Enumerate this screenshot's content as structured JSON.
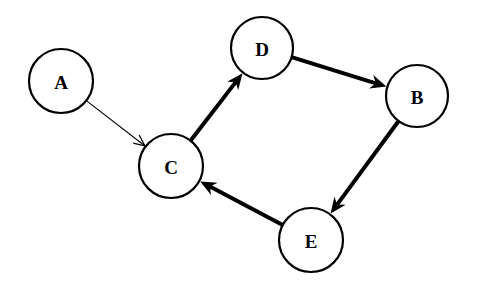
{
  "diagram": {
    "type": "directed-graph",
    "nodes": [
      {
        "id": "A",
        "label": "A",
        "cx": 61,
        "cy": 81,
        "r": 32
      },
      {
        "id": "D",
        "label": "D",
        "cx": 262,
        "cy": 48,
        "r": 31
      },
      {
        "id": "B",
        "label": "B",
        "cx": 417,
        "cy": 96,
        "r": 31
      },
      {
        "id": "C",
        "label": "C",
        "cx": 171,
        "cy": 166,
        "r": 32
      },
      {
        "id": "E",
        "label": "E",
        "cx": 311,
        "cy": 240,
        "r": 32
      }
    ],
    "edges": [
      {
        "from": "A",
        "to": "C",
        "weight": "thin"
      },
      {
        "from": "C",
        "to": "D",
        "weight": "thick"
      },
      {
        "from": "D",
        "to": "B",
        "weight": "thick"
      },
      {
        "from": "B",
        "to": "E",
        "weight": "thick"
      },
      {
        "from": "E",
        "to": "C",
        "weight": "thick"
      }
    ],
    "colors": {
      "background": "#ffffff",
      "stroke": "#000000",
      "node_fill": "#ffffff",
      "text": "#000000"
    }
  }
}
